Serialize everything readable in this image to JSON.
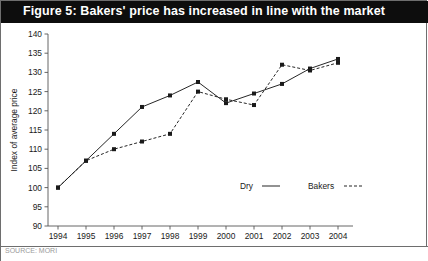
{
  "figure": {
    "title": "Figure 5: Bakers' price has increased in line with the market",
    "title_bar_color": "#0d0d0d",
    "title_text_color": "#ffffff",
    "border_color": "#6e6e6e",
    "footer_note": "SOURCE: MORI"
  },
  "chart_data": {
    "type": "line",
    "title": "Figure 5: Bakers' price has increased in line with the market",
    "xlabel": "",
    "ylabel": "Index of average price",
    "x": [
      1994,
      1995,
      1996,
      1997,
      1998,
      1999,
      2000,
      2001,
      2002,
      2003,
      2004
    ],
    "categories": [
      "1994",
      "1995",
      "1996",
      "1997",
      "1998",
      "1999",
      "2000",
      "2001",
      "2002",
      "2003",
      "2004"
    ],
    "ylim": [
      90,
      140
    ],
    "yticks": [
      90,
      95,
      100,
      105,
      110,
      115,
      120,
      125,
      130,
      135,
      140
    ],
    "ytick_labels": [
      "90",
      "95",
      "100",
      "105",
      "110",
      "115",
      "120",
      "125",
      "130",
      "135",
      "140"
    ],
    "grid": false,
    "legend_position": "bottom-right",
    "series": [
      {
        "name": "Dry",
        "style": "solid",
        "color": "#1a1a1a",
        "marker": "square",
        "values": [
          100,
          107,
          114,
          121,
          124,
          127.5,
          122,
          124.5,
          127,
          131,
          133.5
        ]
      },
      {
        "name": "Bakers",
        "style": "dashed",
        "color": "#1a1a1a",
        "marker": "square",
        "values": [
          100,
          107,
          110,
          112,
          114,
          125,
          123,
          121.5,
          132,
          130.5,
          132.5
        ]
      }
    ]
  }
}
